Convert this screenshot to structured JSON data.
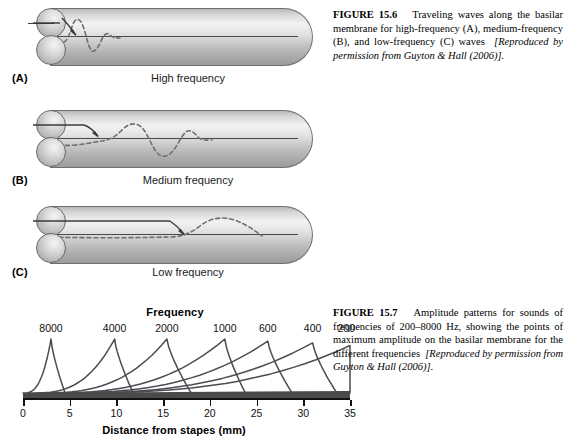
{
  "figure_156": {
    "caption": {
      "label": "FIGURE 15.6",
      "body": "Traveling waves along the basilar membrane for high-frequency (A), medium-frequency (B), and low-frequency (C) waves",
      "source": "[Reproduced by permission from Guyton & Hall (2006)]."
    },
    "panels": [
      {
        "letter": "(A)",
        "caption": "High frequency",
        "frequency_class": "high"
      },
      {
        "letter": "(B)",
        "caption": "Medium frequency",
        "frequency_class": "medium"
      },
      {
        "letter": "(C)",
        "caption": "Low frequency",
        "frequency_class": "low"
      }
    ],
    "parts": {
      "oval_window": "oval-window",
      "round_window": "round-window",
      "tube": "cochlear-duct",
      "wave": "traveling-wave",
      "arrow": "sound-input-arrow"
    }
  },
  "figure_157": {
    "caption": {
      "label": "FIGURE 15.7",
      "body": "Amplitude patterns for sounds of frequencies of 200–8000 Hz, showing the points of maximum amplitude on the basilar membrane for the different frequencies",
      "source": "[Reproduced by permission from Guyton & Hall (2006)]."
    }
  },
  "chart_data": {
    "type": "line",
    "title": "Frequency",
    "xlabel": "Distance from stapes (mm)",
    "ylabel": "",
    "xlim": [
      0,
      35
    ],
    "ylim": [
      0,
      1
    ],
    "grid": false,
    "legend_position": "top-inline",
    "xticks": [
      0,
      5,
      10,
      15,
      20,
      25,
      30,
      35
    ],
    "xtick_labels": [
      "0",
      "5",
      "10",
      "15",
      "20",
      "25",
      "30",
      "35"
    ],
    "series": [
      {
        "name": "8000",
        "unit": "Hz",
        "peak_x": 3.0,
        "peak_y": 1.0,
        "onset_x": 0.0,
        "offset_x": 4.5,
        "label_x": 3.0
      },
      {
        "name": "4000",
        "unit": "Hz",
        "peak_x": 9.8,
        "peak_y": 1.0,
        "onset_x": 0.8,
        "offset_x": 11.8,
        "label_x": 9.8
      },
      {
        "name": "2000",
        "unit": "Hz",
        "peak_x": 15.4,
        "peak_y": 1.0,
        "onset_x": 1.5,
        "offset_x": 18.0,
        "label_x": 15.4
      },
      {
        "name": "1000",
        "unit": "Hz",
        "peak_x": 21.6,
        "peak_y": 1.0,
        "onset_x": 2.0,
        "offset_x": 23.8,
        "label_x": 21.6
      },
      {
        "name": "600",
        "unit": "Hz",
        "peak_x": 26.2,
        "peak_y": 0.96,
        "onset_x": 2.5,
        "offset_x": 28.8,
        "label_x": 26.2
      },
      {
        "name": "400",
        "unit": "Hz",
        "peak_x": 31.0,
        "peak_y": 0.93,
        "onset_x": 3.0,
        "offset_x": 33.6,
        "label_x": 31.0
      },
      {
        "name": "200",
        "unit": "Hz",
        "peak_x": 35.0,
        "peak_y": 0.88,
        "onset_x": 3.5,
        "offset_x": 35.0,
        "label_x": 34.6
      }
    ],
    "basilar_membrane_band": {
      "name": "basilar-membrane",
      "start_x": 0,
      "end_x": 35,
      "color": "#4a4a48"
    }
  },
  "colors": {
    "background": "#ffffff",
    "text": "#000000",
    "curve_stroke": "#4b4b52",
    "band": "#4a4a48",
    "tube_outline": "#6f6f6f",
    "wave_dash": "#6e6e78"
  }
}
